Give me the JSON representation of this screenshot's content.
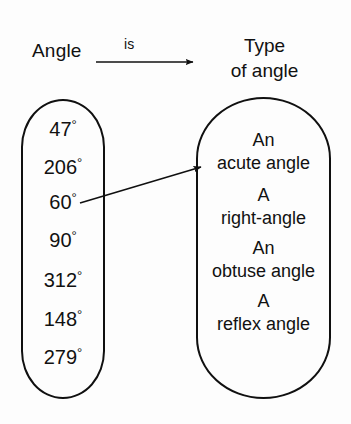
{
  "header": {
    "left_label": "Angle",
    "relation_label": "is",
    "right_label_line1": "Type",
    "right_label_line2": "of angle"
  },
  "angles": {
    "name": "angle-set",
    "items": [
      {
        "value": "47",
        "degree": "°"
      },
      {
        "value": "206",
        "degree": "°"
      },
      {
        "value": "60",
        "degree": "°"
      },
      {
        "value": "90",
        "degree": "°"
      },
      {
        "value": "312",
        "degree": "°"
      },
      {
        "value": "148",
        "degree": "°"
      },
      {
        "value": "279",
        "degree": "°"
      }
    ]
  },
  "types": {
    "name": "angle-type-set",
    "items": [
      {
        "line1": "An",
        "line2": "acute angle"
      },
      {
        "line1": "A",
        "line2": "right-angle"
      },
      {
        "line1": "An",
        "line2": "obtuse angle"
      },
      {
        "line1": "A",
        "line2": "reflex angle"
      }
    ]
  },
  "mapping_arrow": {
    "from": "60",
    "to": "acute angle"
  },
  "colors": {
    "ink": "#101010",
    "background": "#fdfdfd"
  }
}
